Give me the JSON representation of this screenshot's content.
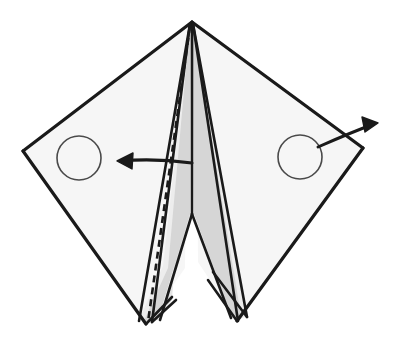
{
  "document": {
    "title": "Origami fold step diagram",
    "type": "line-drawing",
    "width": 395,
    "height": 352,
    "background_color": "#ffffff"
  },
  "colors": {
    "stroke": "#1a1a1a",
    "wing_fill": "#f6f6f6",
    "inner_panel_fill": "#ededed",
    "shaded_panel_fill": "#d6d6d6",
    "circle_stroke": "#4a4a4a",
    "circle_fill": "#ffffff",
    "arrow_stroke": "#1a1a1a",
    "crease_dash_stroke": "#1a1a1a"
  },
  "geometry": {
    "apex": {
      "x": 192,
      "y": 22
    },
    "left_corner": {
      "x": 23,
      "y": 151
    },
    "right_corner": {
      "x": 363,
      "y": 148
    },
    "left_bottom_point": {
      "x": 146,
      "y": 324
    },
    "right_bottom_point": {
      "x": 237,
      "y": 321
    },
    "center_notch": {
      "x": 192,
      "y": 214
    }
  },
  "shapes": {
    "left_wing": {
      "name": "left-wing-panel",
      "points": "192,22 23,151 146,324 185,268 188,30",
      "fill": "#f6f6f6"
    },
    "right_wing": {
      "name": "right-wing-panel",
      "points": "192,22 363,148 237,321 198,262 196,30",
      "fill": "#f6f6f6"
    },
    "left_inner_flap": {
      "name": "left-inner-flap",
      "points": "190,24 163,266 139,320 152,322 189,212",
      "fill": "#ededed"
    },
    "left_shaded_flap": {
      "name": "left-shaded-flap",
      "points": "190,24 168,268 144,321 158,320 190,214",
      "fill": "#d6d6d6"
    },
    "center_left_panel": {
      "name": "center-left-panel",
      "points": "191,24 190,214 160,320 172,300 189,30",
      "fill": "#e3e3e3"
    },
    "right_shaded_flap": {
      "name": "right-shaded-flap",
      "points": "193,24 194,214 232,318 241,316 199,60",
      "fill": "#d6d6d6"
    },
    "right_inner_flap": {
      "name": "right-inner-flap",
      "points": "193,24 194,214 238,320 247,316 200,62",
      "fill": "#ededed"
    }
  },
  "lines": {
    "outer_left_upper": {
      "name": "outer-edge-left-upper",
      "d": "M 192 22 L 23 151"
    },
    "outer_left_lower": {
      "name": "outer-edge-left-lower",
      "d": "M 23 151 L 146 324"
    },
    "outer_right_upper": {
      "name": "outer-edge-right-upper",
      "d": "M 192 22 L 363 148"
    },
    "outer_right_lower": {
      "name": "outer-edge-right-lower",
      "d": "M 363 148 L 237 321"
    },
    "center_spine": {
      "name": "center-spine-line",
      "d": "M 192 23 L 192 214"
    },
    "notch_left": {
      "name": "notch-left-line",
      "d": "M 192 214 L 160 320"
    },
    "notch_right": {
      "name": "notch-right-line",
      "d": "M 192 214 L 231 318"
    },
    "left_flap_edge_a": {
      "name": "left-flap-edge-a",
      "d": "M 190 24 L 139 321"
    },
    "left_flap_edge_b": {
      "name": "left-flap-edge-b",
      "d": "M 190 24 L 152 322"
    },
    "left_flap_return": {
      "name": "left-flap-return-edge",
      "d": "M 146 324 L 172 297"
    },
    "left_flap_return_b": {
      "name": "left-flap-return-edge-b",
      "d": "M 152 322 L 176 300"
    },
    "right_flap_edge_a": {
      "name": "right-flap-edge-a",
      "d": "M 193 24 L 247 317"
    },
    "right_flap_edge_b": {
      "name": "right-flap-edge-b",
      "d": "M 193 24 L 238 321"
    },
    "right_flap_return": {
      "name": "right-flap-return-edge",
      "d": "M 237 321 L 208 280"
    },
    "right_flap_return_b": {
      "name": "right-flap-return-edge-b",
      "d": "M 247 317 L 213 272"
    }
  },
  "crease": {
    "name": "valley-fold-dashed-crease",
    "style": "dashed",
    "dash_pattern": "7 5",
    "d": "M 190 26 L 148 322"
  },
  "markers": [
    {
      "name": "left-target-circle",
      "cx": 79,
      "cy": 158,
      "r": 22
    },
    {
      "name": "right-target-circle",
      "cx": 300,
      "cy": 157,
      "r": 22
    }
  ],
  "arrows": [
    {
      "name": "fold-left-arrow",
      "direction": "left",
      "shaft_d": "M 192 163 Q 155 158 120 161",
      "head_points": "117,161 133,153 132,169"
    },
    {
      "name": "fold-right-arrow",
      "direction": "upper-right",
      "shaft_d": "M 318 147 Q 352 132 374 124",
      "head_points": "378,123 362,117 365,132"
    }
  ],
  "labels": {
    "caption": ""
  }
}
